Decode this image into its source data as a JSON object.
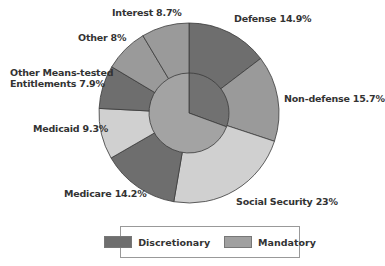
{
  "chart_data": {
    "type": "pie",
    "subtype": "nested-donut",
    "title": "",
    "outer_ring": {
      "categories": [
        "Defense",
        "Non-defense",
        "Social Security",
        "Medicare",
        "Medicaid",
        "Other Means-tested Entitlements",
        "Other",
        "Interest"
      ],
      "values": [
        14.9,
        15.7,
        23,
        14.2,
        9.3,
        7.9,
        8,
        8.7
      ],
      "labels": [
        "Defense 14.9%",
        "Non-defense 15.7%",
        "Social Security 23%",
        "Medicare 14.2%",
        "Medicaid 9.3%",
        "Other Means-tested Entitlements 7.9%",
        "Other 8%",
        "Interest 8.7%"
      ],
      "colors": [
        "#6e6e6e",
        "#9a9a9a",
        "#d0d0d0",
        "#6e6e6e",
        "#d0d0d0",
        "#6e6e6e",
        "#9a9a9a",
        "#9a9a9a"
      ]
    },
    "inner_ring": {
      "categories": [
        "Discretionary",
        "Mandatory"
      ],
      "values": [
        30.6,
        69.4
      ],
      "colors": [
        "#717171",
        "#a3a3a3"
      ]
    },
    "legend": {
      "position": "bottom",
      "entries": [
        {
          "label": "Discretionary",
          "color": "#6e6e6e"
        },
        {
          "label": "Mandatory",
          "color": "#a0a0a0"
        }
      ]
    }
  },
  "labels": {
    "defense": "Defense 14.9%",
    "nondefense": "Non-defense 15.7%",
    "socialsecurity": "Social Security 23%",
    "medicare": "Medicare 14.2%",
    "medicaid": "Medicaid 9.3%",
    "othermeans_1": "Other Means-tested",
    "othermeans_2": "Entitlements 7.9%",
    "other": "Other  8%",
    "interest": "Interest  8.7%"
  },
  "legend": {
    "discretionary": "Discretionary",
    "mandatory": "Mandatory"
  }
}
